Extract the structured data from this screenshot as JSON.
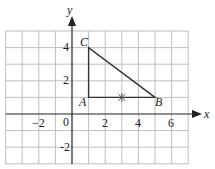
{
  "figure": {
    "type": "coordinate-grid-diagram",
    "axes": {
      "x_label": "x",
      "y_label": "y",
      "origin_label": "0",
      "x_range": [
        -4,
        7
      ],
      "y_range": [
        -3,
        5
      ],
      "x_ticks": [
        {
          "value": -2,
          "label": "−2"
        },
        {
          "value": 2,
          "label": "2"
        },
        {
          "value": 4,
          "label": "4"
        },
        {
          "value": 6,
          "label": "6"
        }
      ],
      "y_ticks": [
        {
          "value": 4,
          "label": "4"
        },
        {
          "value": 2,
          "label": "2"
        },
        {
          "value": -2,
          "label": "-2"
        }
      ]
    },
    "triangle": {
      "vertices": [
        {
          "name": "A",
          "x": 1,
          "y": 1
        },
        {
          "name": "B",
          "x": 5,
          "y": 1
        },
        {
          "name": "C",
          "x": 1,
          "y": 4
        }
      ]
    },
    "marker": {
      "symbol": "×",
      "x": 3,
      "y": 1
    },
    "colors": {
      "grid": "#b8b8b8",
      "axis": "#222222",
      "triangle": "#333333",
      "marker": "#555555"
    }
  }
}
